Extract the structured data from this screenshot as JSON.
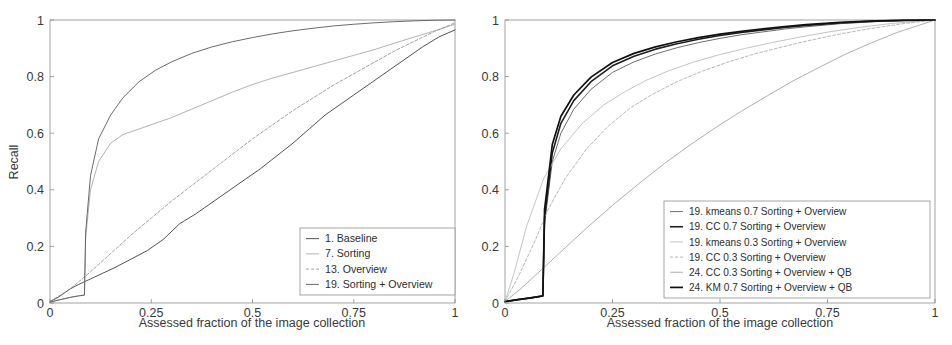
{
  "figure": {
    "background": "#ffffff",
    "panels": [
      "left",
      "right"
    ]
  },
  "left": {
    "axis": {
      "ylabel": "Recall",
      "xlabel": "Assessed fraction of the image collection",
      "xticks": [
        "0",
        "0.25",
        "0.5",
        "0.75",
        "1"
      ],
      "yticks": [
        "0",
        "0.2",
        "0.4",
        "0.6",
        "0.8",
        "1"
      ]
    },
    "legend": {
      "items": [
        {
          "label": "1. Baseline",
          "color": "#3f3f3f",
          "width": 0.9,
          "dash": "none"
        },
        {
          "label": "7. Sorting",
          "color": "#9e9e9e",
          "width": 0.8,
          "dash": "none"
        },
        {
          "label": "13. Overview",
          "color": "#8a8a8a",
          "width": 0.8,
          "dash": "3,2"
        },
        {
          "label": "19. Sorting + Overview",
          "color": "#5a5a5a",
          "width": 0.9,
          "dash": "none"
        }
      ]
    }
  },
  "right": {
    "axis": {
      "ylabel": "Recall",
      "xlabel": "Assessed fraction of the image collection",
      "xticks": [
        "0",
        "0.25",
        "0.5",
        "0.75",
        "1"
      ],
      "yticks": [
        "0",
        "0.2",
        "0.4",
        "0.6",
        "0.8",
        "1"
      ]
    },
    "legend": {
      "items": [
        {
          "label": "19. kmeans 0.7 Sorting + Overview",
          "color": "#5d5d5d",
          "width": 0.9,
          "dash": "none"
        },
        {
          "label": "19. CC 0.7 Sorting + Overview",
          "color": "#1f1f1f",
          "width": 1.6,
          "dash": "none"
        },
        {
          "label": "19. kmeans 0.3 Sorting + Overview",
          "color": "#b4b4b4",
          "width": 0.8,
          "dash": "none"
        },
        {
          "label": "19. CC 0.3 Sorting + Overview",
          "color": "#a5a5a5",
          "width": 0.8,
          "dash": "3,2"
        },
        {
          "label": "24. CC 0.3 Sorting + Overview + QB",
          "color": "#9b9b9b",
          "width": 0.8,
          "dash": "none"
        },
        {
          "label": "24. KM 0.7 Sorting + Overview + QB",
          "color": "#111111",
          "width": 1.7,
          "dash": "none"
        }
      ]
    }
  },
  "chart_data": [
    {
      "type": "line",
      "panel": "left",
      "title": "",
      "xlabel": "Assessed fraction of the image collection",
      "ylabel": "Recall",
      "xlim": [
        0,
        1
      ],
      "ylim": [
        0,
        1
      ],
      "xticks": [
        0,
        0.25,
        0.5,
        0.75,
        1
      ],
      "yticks": [
        0,
        0.2,
        0.4,
        0.6,
        0.8,
        1
      ],
      "grid": false,
      "legend_position": "lower-right",
      "series": [
        {
          "name": "1. Baseline",
          "color": "#3f3f3f",
          "x": [
            0,
            0.02,
            0.05,
            0.07,
            0.085,
            0.1,
            0.13,
            0.16,
            0.2,
            0.24,
            0.28,
            0.32,
            0.36,
            0.4,
            0.44,
            0.48,
            0.52,
            0.56,
            0.6,
            0.64,
            0.68,
            0.72,
            0.76,
            0.8,
            0.84,
            0.88,
            0.92,
            0.96,
            1.0
          ],
          "y": [
            0.005,
            0.02,
            0.05,
            0.065,
            0.075,
            0.085,
            0.105,
            0.125,
            0.155,
            0.185,
            0.225,
            0.28,
            0.315,
            0.355,
            0.395,
            0.435,
            0.475,
            0.52,
            0.565,
            0.615,
            0.665,
            0.705,
            0.745,
            0.785,
            0.825,
            0.865,
            0.905,
            0.94,
            0.965
          ]
        },
        {
          "name": "7. Sorting",
          "color": "#9e9e9e",
          "x": [
            0,
            0.02,
            0.05,
            0.07,
            0.085,
            0.088,
            0.1,
            0.12,
            0.15,
            0.18,
            0.22,
            0.26,
            0.3,
            0.35,
            0.4,
            0.45,
            0.5,
            0.55,
            0.6,
            0.65,
            0.7,
            0.75,
            0.8,
            0.85,
            0.9,
            0.95,
            1.0
          ],
          "y": [
            0.003,
            0.01,
            0.02,
            0.025,
            0.028,
            0.23,
            0.4,
            0.5,
            0.565,
            0.595,
            0.615,
            0.635,
            0.655,
            0.685,
            0.715,
            0.745,
            0.772,
            0.795,
            0.815,
            0.835,
            0.855,
            0.875,
            0.895,
            0.918,
            0.94,
            0.962,
            0.985
          ]
        },
        {
          "name": "13. Overview",
          "color": "#8a8a8a",
          "x": [
            0,
            0.05,
            0.1,
            0.15,
            0.2,
            0.25,
            0.3,
            0.35,
            0.4,
            0.45,
            0.5,
            0.55,
            0.6,
            0.65,
            0.7,
            0.75,
            0.8,
            0.85,
            0.9,
            0.95,
            1.0
          ],
          "y": [
            0.005,
            0.05,
            0.11,
            0.175,
            0.24,
            0.3,
            0.36,
            0.415,
            0.47,
            0.525,
            0.58,
            0.63,
            0.68,
            0.725,
            0.77,
            0.81,
            0.85,
            0.89,
            0.925,
            0.96,
            0.99
          ]
        },
        {
          "name": "19. Sorting + Overview",
          "color": "#5a5a5a",
          "x": [
            0,
            0.02,
            0.05,
            0.07,
            0.085,
            0.088,
            0.1,
            0.12,
            0.15,
            0.18,
            0.22,
            0.26,
            0.3,
            0.35,
            0.4,
            0.45,
            0.5,
            0.55,
            0.6,
            0.65,
            0.7,
            0.75,
            0.8,
            0.85,
            0.9,
            0.95,
            1.0
          ],
          "y": [
            0.003,
            0.01,
            0.02,
            0.025,
            0.028,
            0.25,
            0.45,
            0.58,
            0.665,
            0.725,
            0.782,
            0.822,
            0.852,
            0.882,
            0.905,
            0.923,
            0.938,
            0.951,
            0.962,
            0.971,
            0.979,
            0.985,
            0.99,
            0.994,
            0.997,
            0.999,
            1.0
          ]
        }
      ]
    },
    {
      "type": "line",
      "panel": "right",
      "title": "",
      "xlabel": "Assessed fraction of the image collection",
      "ylabel": "Recall",
      "xlim": [
        0,
        1
      ],
      "ylim": [
        0,
        1
      ],
      "xticks": [
        0,
        0.25,
        0.5,
        0.75,
        1
      ],
      "yticks": [
        0,
        0.2,
        0.4,
        0.6,
        0.8,
        1
      ],
      "grid": false,
      "legend_position": "lower-right",
      "series": [
        {
          "name": "19. kmeans 0.7 Sorting + Overview",
          "color": "#5d5d5d",
          "x": [
            0,
            0.03,
            0.06,
            0.088,
            0.092,
            0.11,
            0.13,
            0.16,
            0.2,
            0.25,
            0.3,
            0.35,
            0.4,
            0.45,
            0.5,
            0.55,
            0.6,
            0.65,
            0.7,
            0.78,
            0.86,
            0.93,
            1.0
          ],
          "y": [
            0.005,
            0.012,
            0.018,
            0.025,
            0.28,
            0.5,
            0.6,
            0.685,
            0.755,
            0.815,
            0.852,
            0.88,
            0.902,
            0.92,
            0.935,
            0.948,
            0.958,
            0.968,
            0.976,
            0.987,
            0.994,
            0.998,
            1.0
          ]
        },
        {
          "name": "19. CC 0.7 Sorting + Overview",
          "color": "#1f1f1f",
          "x": [
            0,
            0.03,
            0.06,
            0.088,
            0.092,
            0.11,
            0.13,
            0.16,
            0.2,
            0.25,
            0.3,
            0.35,
            0.4,
            0.45,
            0.5,
            0.55,
            0.6,
            0.65,
            0.7,
            0.78,
            0.86,
            0.93,
            1.0
          ],
          "y": [
            0.005,
            0.012,
            0.018,
            0.025,
            0.3,
            0.53,
            0.635,
            0.715,
            0.782,
            0.838,
            0.872,
            0.897,
            0.916,
            0.932,
            0.945,
            0.956,
            0.965,
            0.974,
            0.981,
            0.99,
            0.996,
            0.999,
            1.0
          ]
        },
        {
          "name": "19. kmeans 0.3 Sorting + Overview",
          "color": "#b4b4b4",
          "x": [
            0,
            0.02,
            0.05,
            0.09,
            0.13,
            0.18,
            0.23,
            0.28,
            0.33,
            0.38,
            0.44,
            0.5,
            0.56,
            0.62,
            0.68,
            0.75,
            0.82,
            0.9,
            1.0
          ],
          "y": [
            0.005,
            0.1,
            0.27,
            0.44,
            0.545,
            0.635,
            0.7,
            0.748,
            0.788,
            0.82,
            0.852,
            0.878,
            0.9,
            0.92,
            0.938,
            0.957,
            0.973,
            0.988,
            1.0
          ]
        },
        {
          "name": "19. CC 0.3 Sorting + Overview",
          "color": "#a5a5a5",
          "x": [
            0,
            0.03,
            0.07,
            0.1,
            0.14,
            0.19,
            0.24,
            0.29,
            0.34,
            0.4,
            0.46,
            0.52,
            0.58,
            0.64,
            0.7,
            0.77,
            0.85,
            0.93,
            1.0
          ],
          "y": [
            0.005,
            0.09,
            0.22,
            0.33,
            0.44,
            0.545,
            0.625,
            0.688,
            0.735,
            0.782,
            0.82,
            0.852,
            0.88,
            0.903,
            0.925,
            0.948,
            0.97,
            0.988,
            1.0
          ]
        },
        {
          "name": "24. CC 0.3 Sorting + Overview + QB",
          "color": "#9b9b9b",
          "x": [
            0,
            0.04,
            0.09,
            0.14,
            0.19,
            0.25,
            0.31,
            0.37,
            0.43,
            0.49,
            0.55,
            0.61,
            0.67,
            0.73,
            0.79,
            0.85,
            0.91,
            0.96,
            1.0
          ],
          "y": [
            0.005,
            0.055,
            0.125,
            0.195,
            0.265,
            0.345,
            0.42,
            0.492,
            0.558,
            0.62,
            0.678,
            0.732,
            0.785,
            0.832,
            0.878,
            0.918,
            0.955,
            0.98,
            1.0
          ]
        },
        {
          "name": "24. KM 0.7 Sorting + Overview + QB",
          "color": "#111111",
          "x": [
            0,
            0.03,
            0.06,
            0.088,
            0.092,
            0.11,
            0.13,
            0.16,
            0.2,
            0.25,
            0.3,
            0.35,
            0.4,
            0.45,
            0.5,
            0.55,
            0.6,
            0.65,
            0.7,
            0.78,
            0.86,
            0.93,
            1.0
          ],
          "y": [
            0.005,
            0.012,
            0.018,
            0.025,
            0.33,
            0.56,
            0.66,
            0.735,
            0.798,
            0.85,
            0.882,
            0.905,
            0.923,
            0.938,
            0.95,
            0.96,
            0.969,
            0.977,
            0.984,
            0.992,
            0.997,
            0.999,
            1.0
          ]
        }
      ]
    }
  ]
}
